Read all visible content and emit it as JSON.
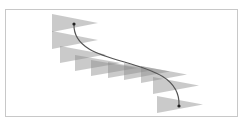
{
  "diagram": {
    "colors": {
      "frame_border": "#c8c8c8",
      "triangle_fill": "#8a8a8a",
      "triangle_opacity": 0.45,
      "curve_stroke": "#555555",
      "endpoint_dot": "#222222"
    },
    "path": {
      "d": "M74,24 C72,72 182,52 179,106"
    },
    "start_point": {
      "x": 74,
      "y": 24
    },
    "end_point": {
      "x": 179,
      "y": 106
    },
    "triangles": [
      {
        "x": 52,
        "y": 14,
        "h": 18
      },
      {
        "x": 52,
        "y": 31,
        "h": 18
      },
      {
        "x": 60,
        "y": 46,
        "h": 17
      },
      {
        "x": 75,
        "y": 55,
        "h": 16
      },
      {
        "x": 91,
        "y": 60,
        "h": 16
      },
      {
        "x": 108,
        "y": 62,
        "h": 16
      },
      {
        "x": 124,
        "y": 63,
        "h": 17
      },
      {
        "x": 141,
        "y": 66,
        "h": 17
      },
      {
        "x": 153,
        "y": 77,
        "h": 17
      },
      {
        "x": 157,
        "y": 96,
        "h": 17
      }
    ],
    "triangle_width": 46
  }
}
